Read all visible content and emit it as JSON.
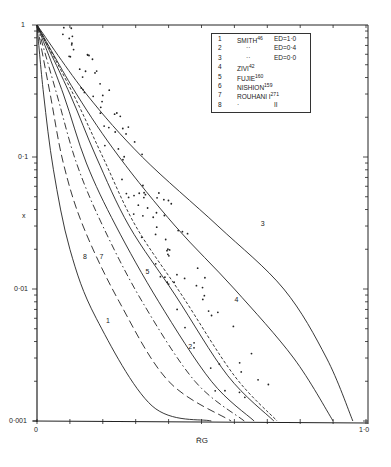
{
  "chart_data": {
    "type": "line",
    "title": "",
    "xlabel": "R̄G",
    "ylabel": "x",
    "xlim": [
      0,
      1.0
    ],
    "ylim": [
      0.001,
      1
    ],
    "yscale": "log",
    "x_tick_labels": [
      "0",
      "1·0"
    ],
    "y_tick_labels": [
      "1",
      "0·1",
      "0·01",
      "0·001"
    ],
    "grid": false,
    "legend_position": "upper right (inside)",
    "legend": [
      {
        "id": "1",
        "name": "SMITH",
        "ref": "46",
        "cond": "ED=1·0"
      },
      {
        "id": "2",
        "name": "··",
        "ref": "",
        "cond": "ED=0·4"
      },
      {
        "id": "3",
        "name": "··",
        "ref": "",
        "cond": "ED=0·0"
      },
      {
        "id": "4",
        "name": "ZIVI",
        "ref": "42",
        "cond": ""
      },
      {
        "id": "5",
        "name": "FUJIE",
        "ref": "160",
        "cond": ""
      },
      {
        "id": "6",
        "name": "NISHION",
        "ref": "159",
        "cond": ""
      },
      {
        "id": "7",
        "name": "ROUHANI I",
        "ref": "271",
        "cond": ""
      },
      {
        "id": "8",
        "name": "·",
        "ref": "",
        "cond": "II"
      }
    ],
    "series": [
      {
        "name": "1",
        "style": "solid",
        "points": [
          [
            0,
            1
          ],
          [
            0.02,
            0.3
          ],
          [
            0.05,
            0.08
          ],
          [
            0.1,
            0.02
          ],
          [
            0.18,
            0.006
          ],
          [
            0.35,
            0.0013
          ],
          [
            0.53,
            0.001
          ]
        ]
      },
      {
        "name": "8",
        "style": "dash-long",
        "points": [
          [
            0,
            1
          ],
          [
            0.04,
            0.3
          ],
          [
            0.08,
            0.09
          ],
          [
            0.14,
            0.03
          ],
          [
            0.25,
            0.008
          ],
          [
            0.4,
            0.002
          ],
          [
            0.59,
            0.001
          ]
        ]
      },
      {
        "name": "7",
        "style": "dash-dot",
        "points": [
          [
            0,
            1
          ],
          [
            0.06,
            0.3
          ],
          [
            0.12,
            0.09
          ],
          [
            0.2,
            0.03
          ],
          [
            0.32,
            0.008
          ],
          [
            0.48,
            0.002
          ],
          [
            0.63,
            0.001
          ]
        ]
      },
      {
        "name": "2",
        "style": "solid",
        "points": [
          [
            0,
            1
          ],
          [
            0.08,
            0.3
          ],
          [
            0.15,
            0.09
          ],
          [
            0.24,
            0.03
          ],
          [
            0.37,
            0.008
          ],
          [
            0.53,
            0.002
          ],
          [
            0.66,
            0.001
          ]
        ]
      },
      {
        "name": "6",
        "style": "solid",
        "points": [
          [
            0,
            1
          ],
          [
            0.1,
            0.3
          ],
          [
            0.18,
            0.1
          ],
          [
            0.28,
            0.03
          ],
          [
            0.42,
            0.009
          ],
          [
            0.58,
            0.0022
          ],
          [
            0.72,
            0.001
          ]
        ]
      },
      {
        "name": "5",
        "style": "dashed",
        "points": [
          [
            0,
            1
          ],
          [
            0.11,
            0.3
          ],
          [
            0.2,
            0.1
          ],
          [
            0.3,
            0.03
          ],
          [
            0.44,
            0.009
          ],
          [
            0.6,
            0.0022
          ],
          [
            0.73,
            0.001
          ]
        ]
      },
      {
        "name": "4",
        "style": "solid",
        "points": [
          [
            0,
            1
          ],
          [
            0.12,
            0.3
          ],
          [
            0.25,
            0.1
          ],
          [
            0.42,
            0.03
          ],
          [
            0.6,
            0.01
          ],
          [
            0.78,
            0.003
          ],
          [
            0.9,
            0.001
          ]
        ]
      },
      {
        "name": "3",
        "style": "solid",
        "points": [
          [
            0,
            1
          ],
          [
            0.15,
            0.3
          ],
          [
            0.32,
            0.1
          ],
          [
            0.55,
            0.03
          ],
          [
            0.75,
            0.01
          ],
          [
            0.88,
            0.003
          ],
          [
            0.96,
            0.001
          ]
        ]
      }
    ],
    "curve_labels": [
      {
        "text": "1",
        "x": 0.21,
        "y": 0.0055
      },
      {
        "text": "8",
        "x": 0.14,
        "y": 0.017
      },
      {
        "text": "7",
        "x": 0.19,
        "y": 0.017
      },
      {
        "text": "5",
        "x": 0.33,
        "y": 0.013
      },
      {
        "text": "2",
        "x": 0.46,
        "y": 0.0035
      },
      {
        "text": "4",
        "x": 0.6,
        "y": 0.008
      },
      {
        "text": "3",
        "x": 0.68,
        "y": 0.03
      }
    ]
  }
}
